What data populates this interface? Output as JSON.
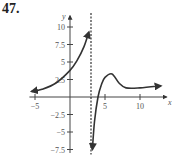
{
  "problem_number": "47.",
  "chart_data": {
    "type": "line",
    "title": "",
    "xlabel": "x",
    "ylabel": "y",
    "xlim": [
      -5.5,
      13.5
    ],
    "ylim": [
      -7.8,
      11.5
    ],
    "x_ticks": [
      -5,
      5,
      10
    ],
    "x_tick_labels": [
      "-5",
      "5",
      "10"
    ],
    "y_ticks": [
      10,
      7.5,
      5,
      2.5,
      -2.5,
      -5,
      -7.5
    ],
    "y_tick_labels": [
      "10",
      "7.5",
      "5",
      "2.5",
      "-2.5",
      "-5",
      "-7.5"
    ],
    "grid": false,
    "legend": null,
    "vertical_asymptote": {
      "x": 3,
      "style": "dashed"
    },
    "series": [
      {
        "name": "left branch",
        "x": [
          -5.5,
          -4,
          -2,
          0,
          1,
          2,
          2.7
        ],
        "y": [
          0.8,
          1.1,
          2.0,
          3.8,
          5.2,
          7.2,
          9.3
        ],
        "arrows": "both"
      },
      {
        "name": "right branch",
        "x": [
          3.2,
          3.5,
          4,
          4.5,
          5,
          6,
          7,
          8,
          10,
          13
        ],
        "y": [
          -7.5,
          -3.5,
          0,
          1.8,
          2.8,
          3.3,
          2.0,
          1.3,
          1.3,
          1.6
        ],
        "arrows": "both"
      }
    ]
  }
}
